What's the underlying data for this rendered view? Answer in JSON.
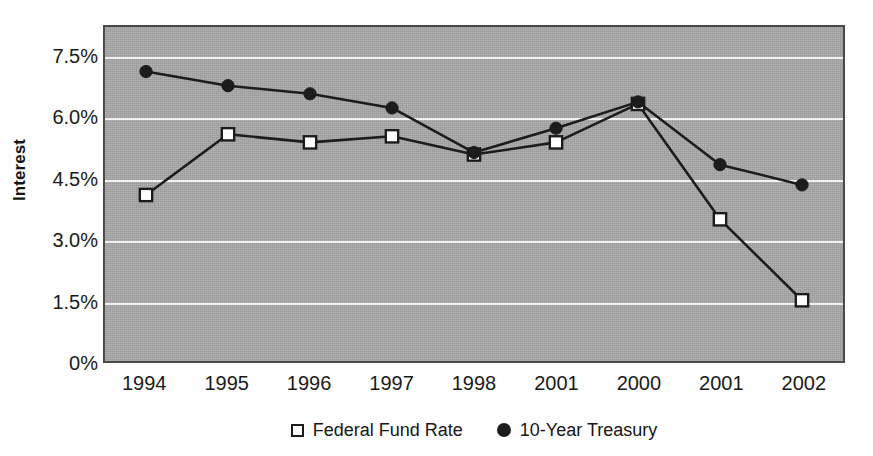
{
  "chart_data": {
    "type": "line",
    "title": "",
    "xlabel": "",
    "ylabel": "Interest",
    "ylim": [
      0,
      8.25
    ],
    "ytick_labels": [
      "7.5%",
      "6.0%",
      "4.5%",
      "3.0%",
      "1.5%",
      "0%"
    ],
    "ytick_values": [
      7.5,
      6.0,
      4.5,
      3.0,
      1.5,
      0
    ],
    "grid": true,
    "grid_axis": "y",
    "legend_position": "bottom",
    "categories": [
      "1994",
      "1995",
      "1996",
      "1997",
      "1998",
      "2001",
      "2000",
      "2001",
      "2002"
    ],
    "series": [
      {
        "name": "Federal Fund Rate",
        "marker": "open-square",
        "color": "#1c1c1c",
        "values": [
          4.1,
          5.6,
          5.4,
          5.55,
          5.1,
          5.4,
          6.35,
          3.5,
          1.5
        ]
      },
      {
        "name": "10-Year Treasury",
        "marker": "filled-circle",
        "color": "#1c1c1c",
        "values": [
          7.15,
          6.8,
          6.6,
          6.25,
          5.15,
          5.75,
          6.4,
          4.85,
          4.35
        ]
      }
    ]
  },
  "axis": {
    "y_title": "Interest"
  },
  "legend": {
    "items": [
      {
        "label": "Federal Fund Rate",
        "marker": "open-square"
      },
      {
        "label": "10-Year Treasury",
        "marker": "filled-circle"
      }
    ]
  },
  "colors": {
    "plot_background": "#a8a8a8",
    "plot_border": "#4a4a4a",
    "gridline": "#f2f2f2",
    "series_ink": "#1c1c1c",
    "text": "#1a1a1a",
    "page_background": "#ffffff"
  }
}
